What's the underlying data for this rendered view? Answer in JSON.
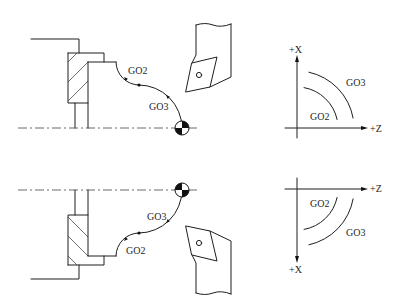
{
  "diagram": {
    "colors": {
      "stroke": "#1e1e1e",
      "background": "#ffffff"
    },
    "top": {
      "turning_view": {
        "path_labels": {
          "first_arc": "GO2",
          "second_arc": "GO3"
        }
      },
      "axes_view": {
        "x_axis_label": "+X",
        "z_axis_label": "+Z",
        "outer_arc_label": "GO3",
        "inner_arc_label": "GO2"
      }
    },
    "bottom": {
      "turning_view": {
        "path_labels": {
          "first_arc": "GO2",
          "second_arc": "GO3"
        }
      },
      "axes_view": {
        "x_axis_label": "+X",
        "z_axis_label": "+Z",
        "outer_arc_label": "GO3",
        "inner_arc_label": "GO2"
      }
    }
  }
}
